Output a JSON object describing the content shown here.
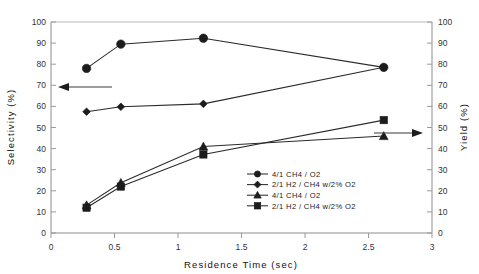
{
  "chart_data": {
    "type": "line",
    "title": "",
    "xlabel": "Residence Time (sec)",
    "ylabel": "Selectivity (%)",
    "y2label": "Yield (%)",
    "xlim": [
      0,
      3
    ],
    "ylim": [
      0,
      100
    ],
    "y2lim": [
      0,
      100
    ],
    "xticks": [
      "0",
      "0.5",
      "1",
      "1.5",
      "2",
      "2.5",
      "3"
    ],
    "xtick_values": [
      0,
      0.5,
      1,
      1.5,
      2,
      2.5,
      3
    ],
    "yticks": [
      "0",
      "10",
      "20",
      "30",
      "40",
      "50",
      "60",
      "70",
      "80",
      "90",
      "100"
    ],
    "ytick_values": [
      0,
      10,
      20,
      30,
      40,
      50,
      60,
      70,
      80,
      90,
      100
    ],
    "y2ticks": [
      "0",
      "10",
      "20",
      "30",
      "40",
      "50",
      "60",
      "70",
      "80",
      "90",
      "100"
    ],
    "y2tick_values": [
      0,
      10,
      20,
      30,
      40,
      50,
      60,
      70,
      80,
      90,
      100
    ],
    "grid": false,
    "legend_position": "inside-lower-center",
    "series": [
      {
        "name": "4/1 CH4 / O2",
        "marker": "circle",
        "axis": "left",
        "x": [
          0.28,
          0.55,
          1.2,
          2.62
        ],
        "y": [
          78,
          89.5,
          92.3,
          78.5
        ]
      },
      {
        "name": "2/1 H2 / CH4 w/2% O2",
        "marker": "diamond",
        "axis": "left",
        "x": [
          0.28,
          0.55,
          1.2,
          2.62
        ],
        "y": [
          57.5,
          59.8,
          61.2,
          78.5
        ]
      },
      {
        "name": "4/1 CH4 / O2",
        "marker": "triangle",
        "axis": "right",
        "x": [
          0.28,
          0.55,
          1.2,
          2.62
        ],
        "y": [
          13.2,
          23.8,
          41.0,
          46.0
        ]
      },
      {
        "name": "2/1 H2 / CH4 w/2% O2",
        "marker": "square",
        "axis": "right",
        "x": [
          0.28,
          0.55,
          1.2,
          2.62
        ],
        "y": [
          12.0,
          22.0,
          37.2,
          53.5
        ]
      }
    ],
    "annotations": [
      {
        "name": "left-axis-pointer",
        "direction": "left",
        "y_value": 69
      },
      {
        "name": "right-axis-pointer",
        "direction": "right",
        "y_value": 47.5
      }
    ]
  }
}
